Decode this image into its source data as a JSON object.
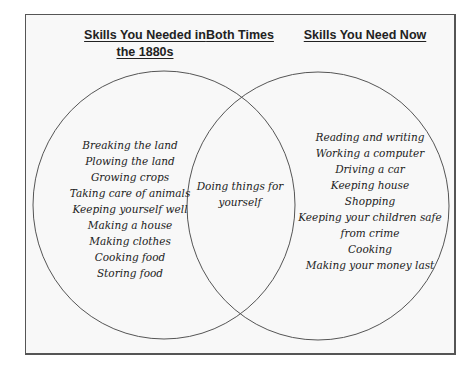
{
  "headers": {
    "left": [
      "Skills You Needed in",
      "the 1880s"
    ],
    "middle": "Both Times",
    "right": "Skills You Need Now"
  },
  "left_items": [
    "Breaking the land",
    "Plowing the land",
    "Growing crops",
    "Taking care of animals",
    "Keeping yourself well",
    "Making a house",
    "Making clothes",
    "Cooking food",
    "Storing food"
  ],
  "middle_items": [
    "Doing things for",
    "yourself"
  ],
  "right_items": [
    "Reading and writing",
    "Working a computer",
    "Driving a car",
    "Keeping house",
    "Shopping",
    "Keeping your children safe",
    "from crime",
    "Cooking",
    "Making your money last"
  ],
  "colors": {
    "stroke": "#555555",
    "background": "#f8f8f8",
    "text": "#222222"
  }
}
